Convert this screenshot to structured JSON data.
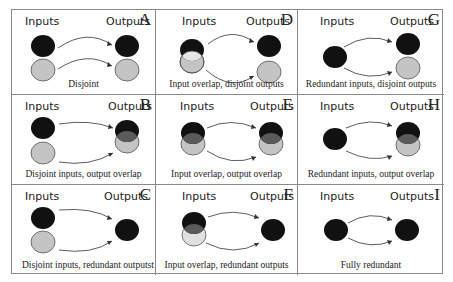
{
  "figure": {
    "colors": {
      "black_set": "#111111",
      "gray_set": "#c4c4c4",
      "overlap_dark": "#5a5a5a",
      "overlap_light": "#e6e6e6",
      "border": "#8a8a8a"
    },
    "panels": [
      {
        "letter": "A",
        "inputs_label": "Inputs",
        "outputs_label": "Outputs",
        "caption": "Disjoint",
        "inputs": "disjoint",
        "outputs": "disjoint"
      },
      {
        "letter": "D",
        "inputs_label": "Inputs",
        "outputs_label": "Outputs",
        "caption": "Input overlap, disjoint outputs",
        "inputs": "overlap",
        "outputs": "disjoint"
      },
      {
        "letter": "G",
        "inputs_label": "Inputs",
        "outputs_label": "Outputs",
        "caption": "Redundant inputs, disjoint outputs",
        "inputs": "redundant",
        "outputs": "disjoint"
      },
      {
        "letter": "B",
        "inputs_label": "Inputs",
        "outputs_label": "Outputs",
        "caption": "Disjoint inputs, output overlap",
        "inputs": "disjoint",
        "outputs": "overlap"
      },
      {
        "letter": "E",
        "inputs_label": "Inputs",
        "outputs_label": "Outputs",
        "caption": "Input overlap, output overlap",
        "inputs": "overlap",
        "outputs": "overlap"
      },
      {
        "letter": "H",
        "inputs_label": "Inputs",
        "outputs_label": "Outputs",
        "caption": "Redundant inputs, output overlap",
        "inputs": "redundant",
        "outputs": "overlap"
      },
      {
        "letter": "C",
        "inputs_label": "Inputs",
        "outputs_label": "Outputs",
        "caption": "Disjoint inputs, redundant outputst",
        "inputs": "disjoint",
        "outputs": "redundant"
      },
      {
        "letter": "F",
        "inputs_label": "Inputs",
        "outputs_label": "Outputs",
        "caption": "Input overlap, redundant outputs",
        "inputs": "overlap",
        "outputs": "redundant"
      },
      {
        "letter": "I",
        "inputs_label": "Inputs",
        "outputs_label": "Outputs",
        "caption": "Fully redundant",
        "inputs": "redundant",
        "outputs": "redundant"
      }
    ]
  }
}
